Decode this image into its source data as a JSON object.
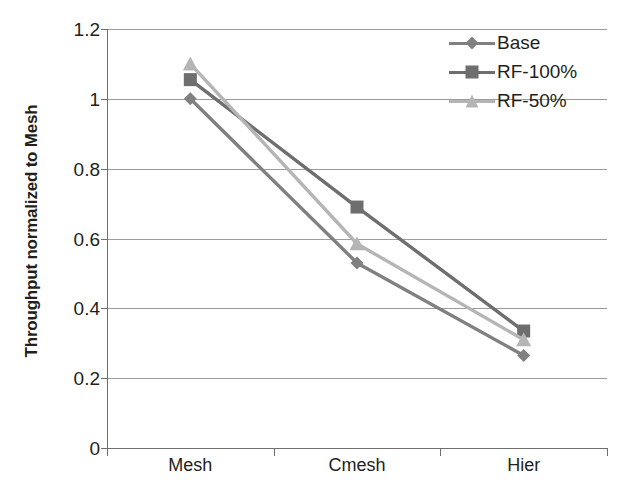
{
  "chart_data": {
    "type": "line",
    "title": "",
    "xlabel": "",
    "ylabel": "Throughput normalized to Mesh",
    "categories": [
      "Mesh",
      "Cmesh",
      "Hier"
    ],
    "ylim": [
      0,
      1.2
    ],
    "ytick_labels": [
      "1.2",
      "1",
      "0.8",
      "0.6",
      "0.4",
      "0.2",
      "0"
    ],
    "ytick_values": [
      1.2,
      1,
      0.8,
      0.6,
      0.4,
      0.2,
      0
    ],
    "grid": true,
    "legend_position": "top-right",
    "series": [
      {
        "name": "Base",
        "marker": "diamond",
        "color": "#808080",
        "values": [
          1.0,
          0.53,
          0.265
        ]
      },
      {
        "name": "RF-100%",
        "marker": "square",
        "color": "#6e6e6e",
        "values": [
          1.055,
          0.69,
          0.335
        ]
      },
      {
        "name": "RF-50%",
        "marker": "triangle",
        "color": "#b5b5b5",
        "values": [
          1.1,
          0.585,
          0.31
        ]
      }
    ]
  },
  "axes": {
    "y_title": "Throughput normalized to Mesh"
  },
  "legend": {
    "items": [
      {
        "label": "Base"
      },
      {
        "label": "RF-100%"
      },
      {
        "label": "RF-50%"
      }
    ]
  }
}
